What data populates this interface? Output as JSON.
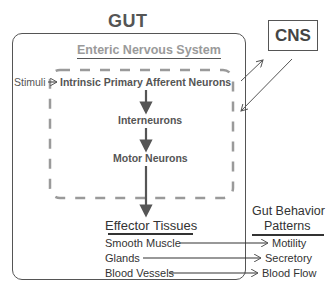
{
  "diagram": {
    "gut_label": "GUT",
    "cns_label": "CNS",
    "ens_label": "Enteric Nervous System",
    "stimuli_label": "Stimuli",
    "neurons": [
      {
        "label": "Intrinsic Primary Afferent Neurons"
      },
      {
        "label": "Interneurons"
      },
      {
        "label": "Motor Neurons"
      }
    ],
    "effector_header": "Effector Tissues",
    "behavior_header_line1": "Gut Behavior",
    "behavior_header_line2": "Patterns",
    "effectors": [
      {
        "tissue": "Smooth Muscle",
        "behavior": "Motility"
      },
      {
        "tissue": "Glands",
        "behavior": "Secretory"
      },
      {
        "tissue": "Blood Vessels",
        "behavior": "Blood Flow"
      }
    ],
    "colors": {
      "box_border": "#555555",
      "dashed_region": "#9a9a9a",
      "arrow": "#555555",
      "ens_title": "#9a9a9a",
      "text": "#333333"
    }
  }
}
